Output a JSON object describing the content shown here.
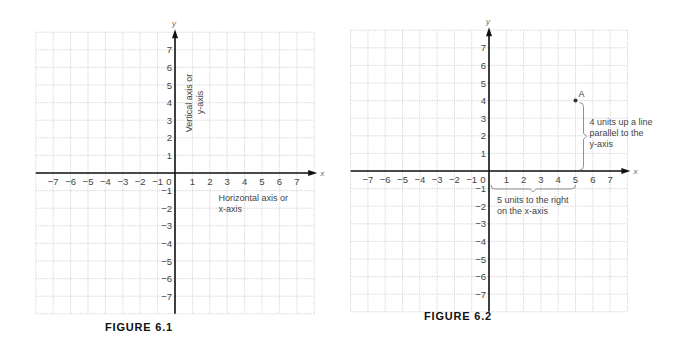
{
  "chart_data": [
    {
      "type": "scatter",
      "title": "FIGURE 6.1",
      "xlabel": "x",
      "ylabel": "y",
      "xlim": [
        -8,
        8
      ],
      "ylim": [
        -8,
        8
      ],
      "grid": true,
      "x_ticks": [
        -7,
        -6,
        -5,
        -4,
        -3,
        -2,
        -1,
        0,
        1,
        2,
        3,
        4,
        5,
        6,
        7
      ],
      "y_ticks": [
        7,
        6,
        5,
        4,
        3,
        2,
        1,
        -1,
        -2,
        -3,
        -4,
        -5,
        -6,
        -7
      ],
      "points": [],
      "annotations": [
        {
          "id": "vertical-axis-note",
          "lines": [
            "Vertical axis or",
            "y-axis"
          ],
          "orientation": "rotated-vertical"
        },
        {
          "id": "horizontal-axis-note",
          "lines": [
            "Horizontal axis or",
            "x-axis"
          ],
          "orientation": "horizontal"
        }
      ]
    },
    {
      "type": "scatter",
      "title": "FIGURE 6.2",
      "xlabel": "x",
      "ylabel": "y",
      "xlim": [
        -8,
        8
      ],
      "ylim": [
        -8,
        8
      ],
      "grid": true,
      "x_ticks": [
        -7,
        -6,
        -5,
        -4,
        -3,
        -2,
        -1,
        0,
        1,
        2,
        3,
        4,
        5,
        6,
        7
      ],
      "y_ticks": [
        7,
        6,
        5,
        4,
        3,
        2,
        1,
        -1,
        -2,
        -3,
        -4,
        -5,
        -6,
        -7
      ],
      "points": [
        {
          "label": "A",
          "x": 5,
          "y": 4
        }
      ],
      "annotations": [
        {
          "id": "up-note",
          "lines": [
            "4 units up a line",
            "parallel to the",
            "y-axis"
          ],
          "brace": "vertical from (5,0) to (5,4)"
        },
        {
          "id": "right-note",
          "lines": [
            "5 units to the right",
            "on the x-axis"
          ],
          "brace": "horizontal from (0,0) to (5,0)"
        }
      ]
    }
  ]
}
